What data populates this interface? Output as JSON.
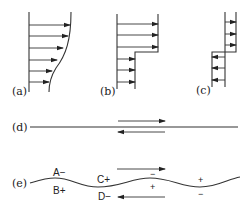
{
  "figure": {
    "panels": [
      {
        "id": "a",
        "label": "(a)",
        "description": "velocity profile with arrows decreasing smoothly toward the bottom"
      },
      {
        "id": "b",
        "label": "(b)",
        "description": "step velocity profile: longer arrows on top, shorter arrows below"
      },
      {
        "id": "c",
        "label": "(c)",
        "description": "shear profile: upper arrows point right, lower arrows point left"
      },
      {
        "id": "d",
        "label": "(d)",
        "description": "flat interface with opposing flows above and below"
      },
      {
        "id": "e",
        "label": "(e)",
        "description": "wavy interface with opposing flows and pressure signs"
      }
    ],
    "panel_e": {
      "labels": {
        "A": "A−",
        "B": "B+",
        "C": "C+",
        "D": "D−"
      },
      "signs": {
        "crest_above": "−",
        "crest_below": "+",
        "trough_above": "+",
        "trough_below": "−"
      }
    }
  }
}
